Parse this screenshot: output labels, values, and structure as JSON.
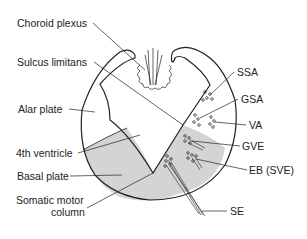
{
  "diagram": {
    "left_labels": [
      {
        "text": "Choroid plexus",
        "x": 17,
        "y": 18
      },
      {
        "text": "Sulcus limitans",
        "x": 17,
        "y": 57
      },
      {
        "text": "Alar plate",
        "x": 18,
        "y": 104
      },
      {
        "text": "4th ventricle",
        "x": 16,
        "y": 148
      },
      {
        "text": "Basal plate",
        "x": 17,
        "y": 171
      },
      {
        "text": "Somatic motor",
        "x": 16,
        "y": 195
      },
      {
        "text": "column",
        "x": 51,
        "y": 207
      }
    ],
    "right_labels": [
      {
        "text": "SSA",
        "x": 237,
        "y": 67
      },
      {
        "text": "GSA",
        "x": 241,
        "y": 94
      },
      {
        "text": "VA",
        "x": 249,
        "y": 120
      },
      {
        "text": "GVE",
        "x": 242,
        "y": 141
      },
      {
        "text": "EB (SVE)",
        "x": 249,
        "y": 165
      },
      {
        "text": "SE",
        "x": 230,
        "y": 206
      }
    ],
    "colors": {
      "line": "#222222",
      "shade": "#d4d4d4"
    }
  }
}
